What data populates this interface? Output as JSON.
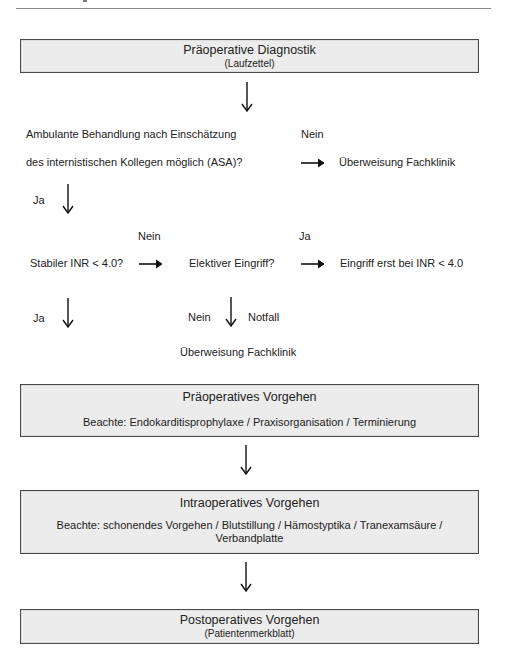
{
  "header": {
    "rule": true
  },
  "flow": {
    "box1": {
      "title": "Präoperative Diagnostik",
      "subtitle": "(Laufzettel)"
    },
    "q1": {
      "line1": "Ambulante Behandlung nach Einschätzung",
      "line2": "des internistischen Kollegen möglich (ASA)?",
      "no_label": "Nein",
      "no_target": "Überweisung Fachklinik",
      "yes_label": "Ja"
    },
    "q2": {
      "text": "Stabiler INR < 4.0?",
      "no_label": "Nein",
      "yes_label": "Ja"
    },
    "q3": {
      "text": "Elektiver Eingriff?",
      "yes_label": "Ja",
      "yes_target": "Eingriff erst bei INR < 4.0",
      "no_label": "Nein",
      "emergency_label": "Notfall",
      "no_target": "Überweisung Fachklinik"
    },
    "box2": {
      "title": "Präoperatives Vorgehen",
      "note": "Beachte: Endokarditisprophylaxe / Praxisorganisation / Terminierung"
    },
    "box3": {
      "title": "Intraoperatives Vorgehen",
      "note_line1": "Beachte: schonendes Vorgehen / Blutstillung / Hämostyptika / Tranexamsäure /",
      "note_line2": "Verbandplatte"
    },
    "box4": {
      "title": "Postoperatives Vorgehen",
      "subtitle": "(Patientenmerkblatt)"
    }
  },
  "colors": {
    "box_fill": "#ececec",
    "box_border": "#4a4a4a",
    "text": "#222222"
  }
}
